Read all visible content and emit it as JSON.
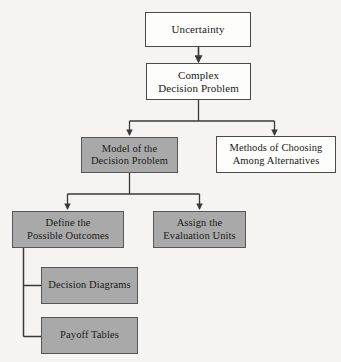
{
  "diagram": {
    "background_color": "#f6f4f2",
    "gray_fill": "#a9a9a9",
    "white_fill": "#fdfdfb",
    "line_color": "#3a3a3a",
    "nodes": [
      {
        "id": "uncertainty",
        "label": "Uncertainty",
        "lines": [
          "Uncertainty"
        ],
        "fill": "white"
      },
      {
        "id": "complex-problem",
        "label": "Complex Decision Problem",
        "lines": [
          "Complex",
          "Decision Problem"
        ],
        "fill": "white"
      },
      {
        "id": "model-problem",
        "label": "Model of the Decision Problem",
        "lines": [
          "Model of the",
          "Decision Problem"
        ],
        "fill": "gray"
      },
      {
        "id": "methods-choosing",
        "label": "Methods of Choosing Among Alternatives",
        "lines": [
          "Methods of Choosing",
          "Among Alternatives"
        ],
        "fill": "white"
      },
      {
        "id": "define-outcomes",
        "label": "Define the Possible Outcomes",
        "lines": [
          "Define the",
          "Possible Outcomes"
        ],
        "fill": "gray"
      },
      {
        "id": "assign-units",
        "label": "Assign the Evaluation Units",
        "lines": [
          "Assign the",
          "Evaluation Units"
        ],
        "fill": "gray"
      },
      {
        "id": "decision-diagrams",
        "label": "Decision Diagrams",
        "lines": [
          "Decision Diagrams"
        ],
        "fill": "gray"
      },
      {
        "id": "payoff-tables",
        "label": "Payoff Tables",
        "lines": [
          "Payoff Tables"
        ],
        "fill": "gray"
      }
    ],
    "edges": [
      {
        "from": "uncertainty",
        "to": "complex-problem",
        "arrow": true
      },
      {
        "from": "complex-problem",
        "to": "model-problem",
        "arrow": true
      },
      {
        "from": "complex-problem",
        "to": "methods-choosing",
        "arrow": true
      },
      {
        "from": "model-problem",
        "to": "define-outcomes",
        "arrow": true
      },
      {
        "from": "model-problem",
        "to": "assign-units",
        "arrow": true
      },
      {
        "from": "define-outcomes",
        "to": "decision-diagrams",
        "arrow": false
      },
      {
        "from": "define-outcomes",
        "to": "payoff-tables",
        "arrow": false
      }
    ]
  }
}
